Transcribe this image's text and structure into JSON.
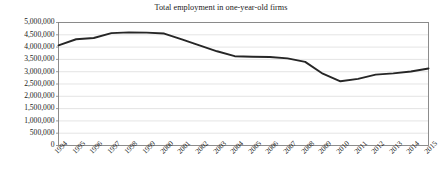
{
  "chart_data": {
    "type": "line",
    "title": "Total employment in one-year-old firms",
    "xlabel": "",
    "ylabel": "",
    "grid": true,
    "legend": false,
    "legend_position": "none",
    "line_color": "#262626",
    "axis_color": "#808080",
    "grid_color": "#d9d9d9",
    "xlim": [
      1994,
      2015
    ],
    "ylim": [
      0,
      5000000
    ],
    "ytick_values": [
      0,
      500000,
      1000000,
      1500000,
      2000000,
      2500000,
      3000000,
      3500000,
      4000000,
      4500000,
      5000000
    ],
    "ytick_labels": [
      "0",
      "500,000",
      "1,000,000",
      "1,500,000",
      "2,000,000",
      "2,500,000",
      "3,000,000",
      "3,500,000",
      "4,000,000",
      "4,500,000",
      "5,000,000"
    ],
    "categories": [
      1994,
      1995,
      1996,
      1997,
      1998,
      1999,
      2000,
      2001,
      2002,
      2003,
      2004,
      2005,
      2006,
      2007,
      2008,
      2009,
      2010,
      2011,
      2012,
      2013,
      2014,
      2015
    ],
    "xtick_labels": [
      "1994",
      "1995",
      "1996",
      "1997",
      "1998",
      "1999",
      "2000",
      "2001",
      "2002",
      "2003",
      "2004",
      "2005",
      "2006",
      "2007",
      "2008",
      "2009",
      "2010",
      "2011",
      "2012",
      "2013",
      "2014",
      "2015"
    ],
    "values": [
      4070000,
      4320000,
      4370000,
      4570000,
      4600000,
      4590000,
      4550000,
      4310000,
      4070000,
      3830000,
      3630000,
      3610000,
      3600000,
      3540000,
      3400000,
      2920000,
      2610000,
      2710000,
      2880000,
      2930000,
      3010000,
      3130000
    ],
    "series": [
      {
        "name": "Total employment in one-year-old firms",
        "values": [
          4070000,
          4320000,
          4370000,
          4570000,
          4600000,
          4590000,
          4550000,
          4310000,
          4070000,
          3830000,
          3630000,
          3610000,
          3600000,
          3540000,
          3400000,
          2920000,
          2610000,
          2710000,
          2880000,
          2930000,
          3010000,
          3130000
        ]
      }
    ]
  }
}
